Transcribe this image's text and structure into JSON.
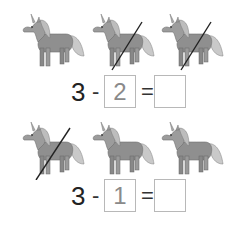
{
  "problems": [
    {
      "unicorns": [
        {
          "icon": "unicorn-icon",
          "crossed": false
        },
        {
          "icon": "unicorn-icon",
          "crossed": true
        },
        {
          "icon": "unicorn-icon",
          "crossed": true
        }
      ],
      "equation": {
        "minuend": "3",
        "minus": "-",
        "subtrahend": "2",
        "equals": "=",
        "answer": ""
      }
    },
    {
      "unicorns": [
        {
          "icon": "unicorn-icon",
          "crossed": true
        },
        {
          "icon": "unicorn-icon",
          "crossed": false
        },
        {
          "icon": "unicorn-icon",
          "crossed": false
        }
      ],
      "equation": {
        "minuend": "3",
        "minus": "-",
        "subtrahend": "1",
        "equals": "=",
        "answer": ""
      }
    }
  ],
  "colors": {
    "unicorn_body": "#8f8f8f",
    "unicorn_light": "#c8c8c8",
    "strike": "#222222",
    "box_border": "#b8b8b8"
  }
}
